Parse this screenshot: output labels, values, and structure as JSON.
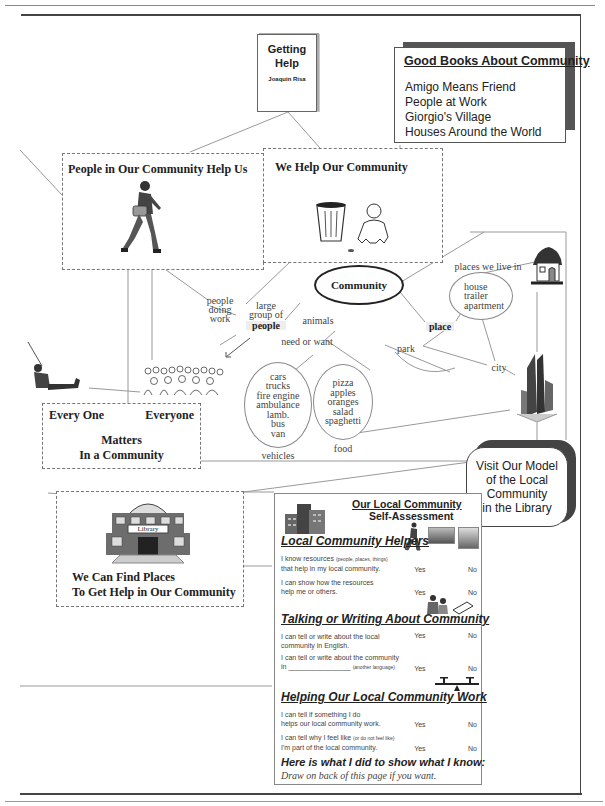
{
  "book_cover": {
    "title_line1": "Getting",
    "title_line2": "Help",
    "author": "Joaquin Risa"
  },
  "good_books": {
    "title": "Good Books About Community",
    "items": [
      "Amigo Means Friend",
      "People at Work",
      "Giorgio's Village",
      "Houses Around the World"
    ]
  },
  "panels": {
    "people_help_us": "People in Our Community Help Us",
    "we_help": "We Help Our Community",
    "matters": {
      "left": "Every One",
      "right": "Everyone",
      "line1": "Matters",
      "line2": "In a Community"
    },
    "library": {
      "sign": "Library",
      "line1": "We Can Find Places",
      "line2": "To Get Help in Our Community"
    },
    "visit_model": [
      "Visit Our Model",
      "of the Local",
      "Community",
      "in the Library"
    ]
  },
  "concept_map": {
    "center": "Community",
    "people_doing_work": [
      "people",
      "doing",
      "work"
    ],
    "large_group": [
      "large",
      "group of"
    ],
    "people": "people",
    "animals": "animals",
    "need_or_want": "need or want",
    "place": "place",
    "park": "park",
    "city": "city",
    "places_we_live_in": "places we live in",
    "homes": [
      "house",
      "trailer",
      "apartment"
    ],
    "vehicles_label": "vehicles",
    "vehicles": [
      "cars",
      "trucks",
      "fire engine",
      "ambulance",
      "lamb.",
      "bus",
      "van"
    ],
    "food_label": "food",
    "food": [
      "pizza",
      "apples",
      "oranges",
      "salad",
      "spaghetti"
    ]
  },
  "self_assessment": {
    "title1": "Our Local Community",
    "title2": "Self-Assessment",
    "sections": [
      {
        "heading": "Local Community Helpers",
        "rows": [
          {
            "q1": "I know resources",
            "q1_small": "(people, places, things)",
            "q2": "that help in my local community.",
            "yes": "Yes",
            "no": "No"
          },
          {
            "q1": "I can show how the resources",
            "q1_small": "",
            "q2": "help me or others.",
            "yes": "Yes",
            "no": "No"
          }
        ]
      },
      {
        "heading": "Talking or Writing About Community",
        "rows": [
          {
            "q1": "I can tell or write about the local",
            "q1_small": "",
            "q2": "community in English.",
            "yes": "Yes",
            "no": "No"
          },
          {
            "q1": "I can tell or write about the community",
            "q1_small": "",
            "q2": "in ________________",
            "q2_small": "(another language)",
            "yes": "Yes",
            "no": "No"
          }
        ]
      },
      {
        "heading": "Helping Our Local Community Work",
        "rows": [
          {
            "q1": "I can tell if something I do",
            "q1_small": "",
            "q2": "helps our local community work.",
            "yes": "Yes",
            "no": "No"
          },
          {
            "q1": "I can tell why I feel like",
            "q1_small": "(or do not feel like)",
            "q2": "I'm part of the local community.",
            "yes": "Yes",
            "no": "No"
          }
        ]
      }
    ],
    "footer_title": "Here is what I did to show what I know:",
    "footer_note": "Draw on back of this page if you want."
  }
}
